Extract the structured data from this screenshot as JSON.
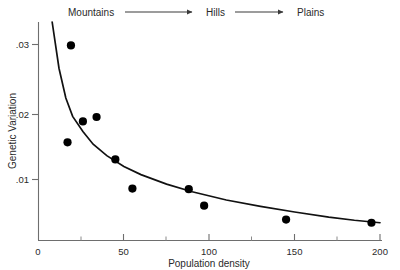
{
  "chart_data": {
    "type": "scatter",
    "title": "",
    "xlabel": "Population density",
    "ylabel": "Genetic Variation",
    "xlim": [
      0,
      200
    ],
    "ylim": [
      0,
      0.0345
    ],
    "grid": false,
    "legend": null,
    "x_ticks": [
      "0",
      "50",
      "100",
      "150",
      "200"
    ],
    "x_tick_values": [
      0,
      50,
      100,
      150,
      200
    ],
    "x_minor_tick_values": [
      25,
      75,
      125,
      175
    ],
    "y_ticks": [
      ".01",
      ".02",
      ".03"
    ],
    "y_tick_values": [
      0.01,
      0.02,
      0.03
    ],
    "x": [
      15,
      17,
      26,
      34,
      55,
      55,
      88,
      97,
      97,
      145,
      195
    ],
    "y": [
      0.0305,
      0.0149,
      0.0185,
      0.0189,
      0.0128,
      0.0128,
      0.0082,
      0.0081,
      0.0055,
      0.0033,
      0.0027
    ],
    "points": [
      {
        "x": 19,
        "y": 0.0308
      },
      {
        "x": 17,
        "y": 0.0155
      },
      {
        "x": 26,
        "y": 0.0188
      },
      {
        "x": 34,
        "y": 0.0195
      },
      {
        "x": 45,
        "y": 0.0128
      },
      {
        "x": 55,
        "y": 0.0082
      },
      {
        "x": 88,
        "y": 0.0081
      },
      {
        "x": 97,
        "y": 0.0055
      },
      {
        "x": 145,
        "y": 0.0033
      },
      {
        "x": 195,
        "y": 0.0028
      }
    ],
    "fit_curve": {
      "description": "decaying power-law trend line through the scatter",
      "points": [
        {
          "x": 8,
          "y": 0.0345
        },
        {
          "x": 12,
          "y": 0.0272
        },
        {
          "x": 16,
          "y": 0.0225
        },
        {
          "x": 20,
          "y": 0.0196
        },
        {
          "x": 26,
          "y": 0.0172
        },
        {
          "x": 32,
          "y": 0.0152
        },
        {
          "x": 40,
          "y": 0.0134
        },
        {
          "x": 50,
          "y": 0.0117
        },
        {
          "x": 60,
          "y": 0.0104
        },
        {
          "x": 75,
          "y": 0.0089
        },
        {
          "x": 90,
          "y": 0.0077
        },
        {
          "x": 110,
          "y": 0.0064
        },
        {
          "x": 130,
          "y": 0.0054
        },
        {
          "x": 150,
          "y": 0.0045
        },
        {
          "x": 170,
          "y": 0.0037
        },
        {
          "x": 185,
          "y": 0.0032
        },
        {
          "x": 200,
          "y": 0.0028
        }
      ]
    },
    "annotations": {
      "gradient_labels": [
        "Mountains",
        "Hills",
        "Plains"
      ],
      "arrows": 2,
      "note": "habitat gradient arrow running left to right above the plot"
    }
  },
  "axes": {
    "x_axis_label": "Population density",
    "y_axis_label": "Genetic Variation",
    "origin_label": "0"
  },
  "gradient": {
    "labels": [
      {
        "text": "Mountains"
      },
      {
        "text": "Hills"
      },
      {
        "text": "Plains"
      }
    ]
  }
}
